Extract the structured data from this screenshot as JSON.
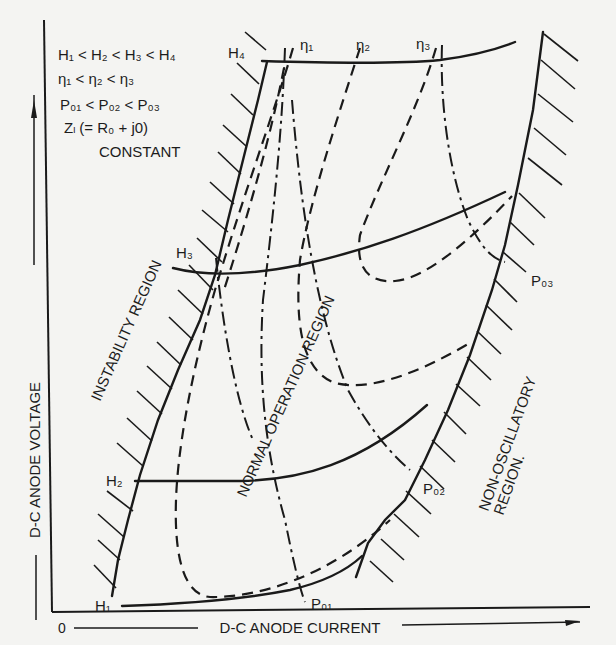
{
  "legend": {
    "line1": "H₁ < H₂ < H₃ < H₄",
    "line2": "η₁ < η₂ < η₃",
    "line3": "P₀₁ < P₀₂ < P₀₃",
    "line4": "Zₗ (= R₀ + j0)",
    "line5": "CONSTANT"
  },
  "axes": {
    "origin": "0",
    "x_label": "D-C ANODE CURRENT",
    "y_label": "D-C ANODE VOLTAGE"
  },
  "regions": {
    "instability": "INSTABILITY REGION",
    "normal": "NORMAL OPERATION REGION",
    "non_osc_line1": "NON-OSCILLATORY",
    "non_osc_line2": "REGION."
  },
  "curve_labels": {
    "H1": "H₁",
    "H2": "H₂",
    "H3": "H₃",
    "H4": "H₄",
    "eta1": "η₁",
    "eta2": "η₂",
    "eta3": "η₃",
    "P01": "P₀₁",
    "P02": "P₀₂",
    "P03": "P₀₃"
  },
  "line_styles": {
    "magnetic_field_H": "solid",
    "efficiency_eta": "dashed",
    "output_power_P0": "dash-dot"
  }
}
